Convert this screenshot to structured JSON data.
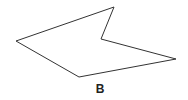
{
  "figure": {
    "shape": "concave pentagon",
    "vertices": [
      [
        16,
        41
      ],
      [
        114,
        7
      ],
      [
        101,
        39
      ],
      [
        176,
        59
      ],
      [
        79,
        77
      ]
    ],
    "stroke_color": "#333333",
    "label": "B"
  }
}
